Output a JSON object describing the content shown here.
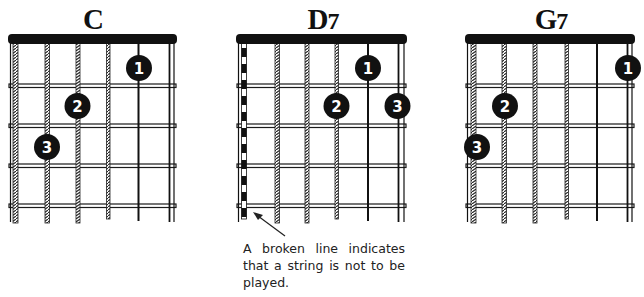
{
  "chords": [
    {
      "name": "C",
      "name_letter": "C",
      "name_suffix": "",
      "strings_muted": [],
      "fingers": [
        {
          "finger": "1",
          "string": 5,
          "fret": 1
        },
        {
          "finger": "2",
          "string": 3,
          "fret": 2
        },
        {
          "finger": "3",
          "string": 2,
          "fret": 3
        }
      ]
    },
    {
      "name": "D7",
      "name_letter": "D",
      "name_suffix": "7",
      "strings_muted": [
        1
      ],
      "fingers": [
        {
          "finger": "1",
          "string": 5,
          "fret": 1
        },
        {
          "finger": "2",
          "string": 4,
          "fret": 2
        },
        {
          "finger": "3",
          "string": 6,
          "fret": 2
        }
      ]
    },
    {
      "name": "G7",
      "name_letter": "G",
      "name_suffix": "7",
      "strings_muted": [],
      "fingers": [
        {
          "finger": "1",
          "string": 6,
          "fret": 1
        },
        {
          "finger": "2",
          "string": 2,
          "fret": 2
        },
        {
          "finger": "3",
          "string": 1,
          "fret": 3
        }
      ]
    }
  ],
  "annotation": {
    "text": "A broken line indicates that a string is not to be played.",
    "points_to": "D7 muted string 1"
  },
  "colors": {
    "ink": "#111111",
    "background": "#ffffff",
    "fret": "#1a1a1a"
  }
}
